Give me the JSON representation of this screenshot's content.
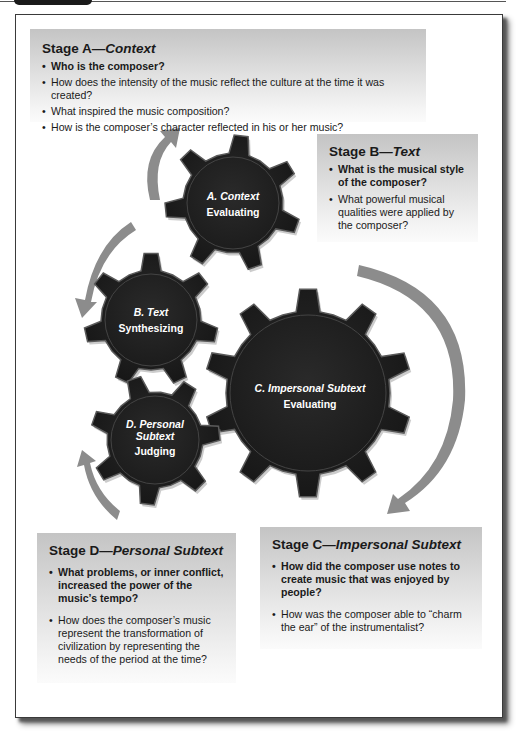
{
  "stages": {
    "a": {
      "title_prefix": "Stage A—",
      "title_italic": "Context",
      "questions": [
        {
          "text": "Who is the composer?",
          "bold": true
        },
        {
          "text": "How does the intensity of the music reflect the culture at the time it was created?",
          "bold": false
        },
        {
          "text": "What inspired the music composition?",
          "bold": false
        },
        {
          "text": "How is the composer’s character reflected in his or her music?",
          "bold": false
        }
      ]
    },
    "b": {
      "title_prefix": "Stage B—",
      "title_italic": "Text",
      "questions": [
        {
          "text": "What is the musical style of the composer?",
          "bold": true
        },
        {
          "text": "What powerful musical qualities were applied by the composer?",
          "bold": false
        }
      ]
    },
    "c": {
      "title_prefix": "Stage C—",
      "title_italic": "Impersonal Subtext",
      "questions": [
        {
          "text": "How did the composer use notes to create music that was enjoyed by people?",
          "bold": true
        },
        {
          "text": "How was the composer able to “charm the ear” of the instrumentalist?",
          "bold": false
        }
      ]
    },
    "d": {
      "title_prefix": "Stage D—",
      "title_italic": "Personal Subtext",
      "questions": [
        {
          "text": "What problems, or inner conflict, increased the power of the music’s tempo?",
          "bold": true
        },
        {
          "text": "How does the composer’s music represent the transformation of civilization by representing the needs of the period at the time?",
          "bold": false
        }
      ]
    }
  },
  "gears": {
    "a": {
      "title": "A. Context",
      "skill": "Evaluating"
    },
    "b": {
      "title": "B. Text",
      "skill": "Synthesizing"
    },
    "c": {
      "title": "C. Impersonal Subtext",
      "skill": "Evaluating"
    },
    "d": {
      "title_line1": "D. Personal",
      "title_line2": "Subtext",
      "skill": "Judging"
    }
  },
  "colors": {
    "gear_fill": "#1e1e1e",
    "gear_edge": "#5a5a5a",
    "arrow": "#8c8c8c",
    "box_top": "#c4c4c4",
    "box_bottom": "#fbfbfb"
  }
}
